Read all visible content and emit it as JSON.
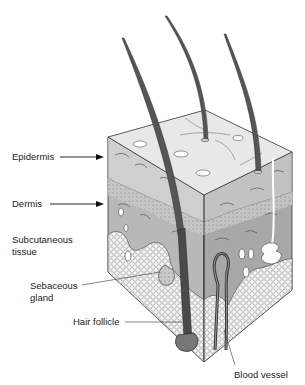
{
  "figure": {
    "labels": {
      "epidermis": "Epidermis",
      "dermis": "Dermis",
      "subcutaneous": "Subcutaneous tissue",
      "sebaceous": "Sebaceous gland",
      "hair_follicle": "Hair follicle",
      "blood_vessel": "Blood vessel"
    },
    "colors": {
      "epidermis_top": "#e6e6e6",
      "dermis": "#b4b4b4",
      "dermis_dark": "#9c9c9c",
      "fat": "#f4f4f4",
      "hair": "#555555",
      "vessel": "#444444",
      "outline": "#333333"
    },
    "hair_count": 3
  }
}
